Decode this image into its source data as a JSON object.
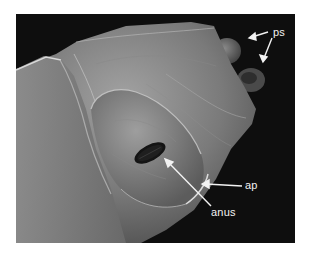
{
  "figure": {
    "type": "SEM micrograph",
    "colors": {
      "background": "#0e0e0e",
      "specimen_light": "#9a9a9a",
      "specimen_mid": "#6e6e6e",
      "specimen_dark": "#3a3a3a",
      "label": "#f2f2f2"
    },
    "labels": [
      {
        "id": "ps",
        "text": "ps"
      },
      {
        "id": "ap",
        "text": "ap"
      },
      {
        "id": "anus",
        "text": "anus"
      }
    ]
  }
}
